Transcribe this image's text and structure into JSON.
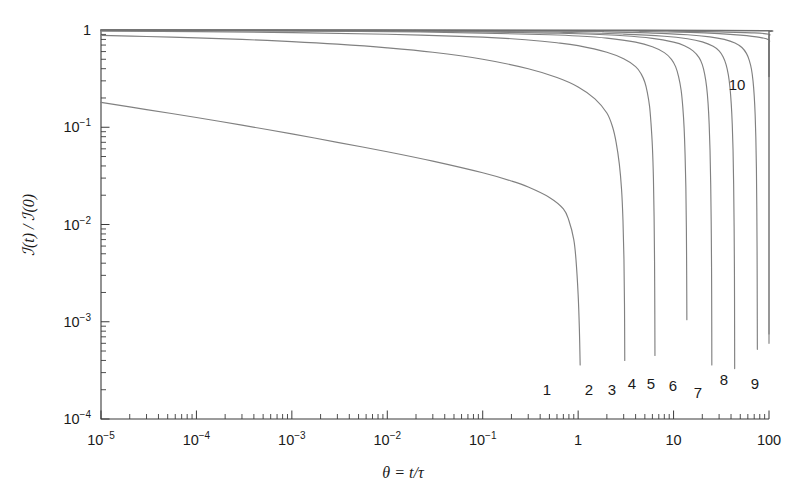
{
  "figure": {
    "background": "#ffffff",
    "curve_color": "#818181",
    "axis_color": "#3b3b3b",
    "text_color": "#1a1a1a"
  },
  "chart_data": {
    "type": "line",
    "title": "",
    "subtitle": "",
    "xlabel": "θ = t/τ",
    "ylabel": "ℐ(t) / ℐ(0)",
    "xscale": "log",
    "yscale": "log",
    "xlim": [
      1e-05,
      100
    ],
    "ylim": [
      0.0001,
      1
    ],
    "grid": false,
    "legend": "inline-curve-labels",
    "xtick_labels": [
      "10⁻⁵",
      "10⁻⁴",
      "10⁻³",
      "10⁻²",
      "10⁻¹",
      "1",
      "10",
      "100"
    ],
    "xtick_values": [
      1e-05,
      0.0001,
      0.001,
      0.01,
      0.1,
      1,
      10,
      100
    ],
    "ytick_labels": [
      "1",
      "10⁻¹",
      "10⁻²",
      "10⁻³",
      "10⁻⁴"
    ],
    "ytick_values": [
      1,
      0.1,
      0.01,
      0.001,
      0.0001
    ],
    "minor_ticks": true,
    "series": [
      {
        "name": "1",
        "label": "1",
        "label_at": {
          "x": 0.62,
          "y": 0.00021
        },
        "points": [
          [
            1e-05,
            0.18
          ],
          [
            3e-05,
            0.152
          ],
          [
            0.0001,
            0.126
          ],
          [
            0.0003,
            0.105
          ],
          [
            0.001,
            0.0855
          ],
          [
            0.003,
            0.07
          ],
          [
            0.01,
            0.056
          ],
          [
            0.03,
            0.0448
          ],
          [
            0.1,
            0.034
          ],
          [
            0.2,
            0.028
          ],
          [
            0.3,
            0.0243
          ],
          [
            0.5,
            0.019
          ],
          [
            0.7,
            0.0145
          ],
          [
            0.8,
            0.011
          ],
          [
            0.9,
            0.007
          ],
          [
            0.95,
            0.0043
          ],
          [
            1.0,
            0.0019
          ],
          [
            1.03,
            0.00085
          ],
          [
            1.05,
            0.00036
          ]
        ]
      },
      {
        "name": "2",
        "label": "2",
        "label_at": {
          "x": 1.55,
          "y": 0.00021
        },
        "points": [
          [
            1e-05,
            0.88
          ],
          [
            3e-05,
            0.858
          ],
          [
            0.0001,
            0.83
          ],
          [
            0.0003,
            0.8
          ],
          [
            0.001,
            0.76
          ],
          [
            0.003,
            0.715
          ],
          [
            0.01,
            0.655
          ],
          [
            0.03,
            0.59
          ],
          [
            0.1,
            0.5
          ],
          [
            0.3,
            0.4
          ],
          [
            0.6,
            0.325
          ],
          [
            1.0,
            0.26
          ],
          [
            1.5,
            0.196
          ],
          [
            2.0,
            0.14
          ],
          [
            2.3,
            0.1
          ],
          [
            2.5,
            0.07
          ],
          [
            2.7,
            0.042
          ],
          [
            2.85,
            0.023
          ],
          [
            2.95,
            0.011
          ],
          [
            3.02,
            0.0044
          ],
          [
            3.06,
            0.0015
          ],
          [
            3.08,
            0.0004
          ]
        ]
      },
      {
        "name": "3",
        "label": "3",
        "label_at": {
          "x": 2.55,
          "y": 0.00021
        },
        "points": [
          [
            1e-05,
            0.975
          ],
          [
            0.0001,
            0.962
          ],
          [
            0.001,
            0.94
          ],
          [
            0.01,
            0.905
          ],
          [
            0.1,
            0.845
          ],
          [
            0.3,
            0.79
          ],
          [
            0.6,
            0.74
          ],
          [
            1.0,
            0.69
          ],
          [
            2.0,
            0.59
          ],
          [
            3.0,
            0.505
          ],
          [
            4.0,
            0.42
          ],
          [
            4.6,
            0.35
          ],
          [
            5.0,
            0.29
          ],
          [
            5.3,
            0.23
          ],
          [
            5.6,
            0.165
          ],
          [
            5.8,
            0.11
          ],
          [
            6.0,
            0.063
          ],
          [
            6.15,
            0.03
          ],
          [
            6.25,
            0.012
          ],
          [
            6.32,
            0.0042
          ],
          [
            6.36,
            0.0012
          ],
          [
            6.38,
            0.00045
          ]
        ]
      },
      {
        "name": "4",
        "label": "4",
        "label_at": {
          "x": 4.2,
          "y": 0.00021
        },
        "points": [
          [
            1e-05,
            0.99
          ],
          [
            0.001,
            0.978
          ],
          [
            0.01,
            0.962
          ],
          [
            0.1,
            0.93
          ],
          [
            0.5,
            0.893
          ],
          [
            1.0,
            0.868
          ],
          [
            2.0,
            0.825
          ],
          [
            4.0,
            0.75
          ],
          [
            6.0,
            0.672
          ],
          [
            8.0,
            0.585
          ],
          [
            9.5,
            0.5
          ],
          [
            10.5,
            0.42
          ],
          [
            11.3,
            0.33
          ],
          [
            12.0,
            0.24
          ],
          [
            12.5,
            0.16
          ],
          [
            12.9,
            0.098
          ],
          [
            13.2,
            0.052
          ],
          [
            13.45,
            0.024
          ],
          [
            13.62,
            0.009
          ],
          [
            13.72,
            0.003
          ],
          [
            13.78,
            0.00105
          ]
        ]
      },
      {
        "name": "5",
        "label": "5",
        "label_at": {
          "x": 5.6,
          "y": 0.00021
        },
        "points": [
          [
            1e-05,
            0.994
          ],
          [
            0.01,
            0.976
          ],
          [
            0.1,
            0.955
          ],
          [
            0.5,
            0.93
          ],
          [
            1.0,
            0.915
          ],
          [
            3.0,
            0.872
          ],
          [
            6.0,
            0.82
          ],
          [
            10.0,
            0.75
          ],
          [
            13.0,
            0.69
          ],
          [
            16.0,
            0.61
          ],
          [
            18.5,
            0.52
          ],
          [
            20.0,
            0.44
          ],
          [
            21.2,
            0.35
          ],
          [
            22.2,
            0.26
          ],
          [
            23.0,
            0.175
          ],
          [
            23.6,
            0.108
          ],
          [
            24.1,
            0.058
          ],
          [
            24.5,
            0.026
          ],
          [
            24.8,
            0.01
          ],
          [
            25.0,
            0.0036
          ],
          [
            25.12,
            0.001
          ],
          [
            25.17,
            0.00036
          ]
        ]
      },
      {
        "name": "6",
        "label": "6",
        "label_at": {
          "x": 7.8,
          "y": 0.00021
        },
        "points": [
          [
            1e-05,
            0.996
          ],
          [
            0.1,
            0.968
          ],
          [
            1.0,
            0.938
          ],
          [
            3.0,
            0.908
          ],
          [
            8.0,
            0.862
          ],
          [
            14.0,
            0.812
          ],
          [
            20.0,
            0.755
          ],
          [
            26.0,
            0.68
          ],
          [
            30.0,
            0.61
          ],
          [
            33.0,
            0.53
          ],
          [
            35.5,
            0.44
          ],
          [
            37.5,
            0.345
          ],
          [
            39.0,
            0.255
          ],
          [
            40.2,
            0.175
          ],
          [
            41.2,
            0.108
          ],
          [
            42.0,
            0.058
          ],
          [
            42.6,
            0.026
          ],
          [
            43.1,
            0.0095
          ],
          [
            43.45,
            0.003
          ],
          [
            43.6,
            0.0009
          ],
          [
            43.68,
            0.00033
          ]
        ]
      },
      {
        "name": "7",
        "label": "7",
        "label_at": {
          "x": 12.5,
          "y": 0.00014
        },
        "points": [
          [
            1e-05,
            0.997
          ],
          [
            0.5,
            0.975
          ],
          [
            2.0,
            0.955
          ],
          [
            6.0,
            0.93
          ],
          [
            14.0,
            0.893
          ],
          [
            24.0,
            0.85
          ],
          [
            34.0,
            0.8
          ],
          [
            44.0,
            0.735
          ],
          [
            52.0,
            0.66
          ],
          [
            58.0,
            0.575
          ],
          [
            62.0,
            0.49
          ],
          [
            65.5,
            0.395
          ],
          [
            68.0,
            0.3
          ],
          [
            70.0,
            0.21
          ],
          [
            71.6,
            0.135
          ],
          [
            72.8,
            0.078
          ],
          [
            73.8,
            0.038
          ],
          [
            74.5,
            0.015
          ],
          [
            75.0,
            0.0052
          ],
          [
            75.3,
            0.0016
          ],
          [
            75.5,
            0.00052
          ]
        ]
      },
      {
        "name": "8",
        "label": "8",
        "label_at": {
          "x": 28.0,
          "y": 0.0003
        },
        "points": [
          [
            1e-05,
            0.998
          ],
          [
            1.0,
            0.982
          ],
          [
            5.0,
            0.966
          ],
          [
            15.0,
            0.945
          ],
          [
            30.0,
            0.918
          ],
          [
            50.0,
            0.885
          ],
          [
            80.0,
            0.84
          ],
          [
            110.0,
            0.79
          ],
          [
            140.0,
            0.725
          ],
          [
            165.0,
            0.65
          ],
          [
            185.0,
            0.565
          ],
          [
            200.0,
            0.475
          ],
          [
            212.0,
            0.38
          ],
          [
            222.0,
            0.285
          ],
          [
            229.0,
            0.198
          ],
          [
            234.5,
            0.128
          ],
          [
            239.0,
            0.075
          ],
          [
            242.5,
            0.038
          ],
          [
            245.0,
            0.0165
          ],
          [
            247.0,
            0.006
          ],
          [
            248.2,
            0.0019
          ],
          [
            249.0,
            0.0006
          ]
        ]
      },
      {
        "name": "9",
        "label": "9",
        "label_at": {
          "x": 62.0,
          "y": 0.0003
        },
        "points": [
          [
            1e-05,
            0.9985
          ],
          [
            2.0,
            0.988
          ],
          [
            10.0,
            0.975
          ],
          [
            30.0,
            0.958
          ],
          [
            70.0,
            0.935
          ],
          [
            130.0,
            0.905
          ],
          [
            220.0,
            0.865
          ],
          [
            330.0,
            0.815
          ],
          [
            440.0,
            0.752
          ],
          [
            530.0,
            0.68
          ],
          [
            600.0,
            0.6
          ],
          [
            655.0,
            0.51
          ],
          [
            700.0,
            0.415
          ],
          [
            735.0,
            0.318
          ],
          [
            762.0,
            0.225
          ],
          [
            782.0,
            0.148
          ],
          [
            797.0,
            0.088
          ],
          [
            808.0,
            0.045
          ],
          [
            816.0,
            0.0195
          ],
          [
            822.0,
            0.0072
          ],
          [
            826.0,
            0.0023
          ],
          [
            828.5,
            0.00075
          ]
        ]
      },
      {
        "name": "10",
        "label": "10",
        "label_at": {
          "x": 62.0,
          "y": 0.31
        },
        "points": [
          [
            1e-05,
            0.9993
          ],
          [
            5.0,
            0.995
          ],
          [
            30.0,
            0.988
          ],
          [
            100.0,
            0.98
          ],
          [
            300.0,
            0.968
          ],
          [
            700.0,
            0.952
          ],
          [
            1400.0,
            0.932
          ],
          [
            2200.0,
            0.908
          ],
          [
            3000.0,
            0.88
          ],
          [
            3800.0,
            0.845
          ],
          [
            4500.0,
            0.805
          ],
          [
            5100.0,
            0.76
          ],
          [
            5600.0,
            0.71
          ],
          [
            6000.0,
            0.655
          ],
          [
            6350.0,
            0.595
          ],
          [
            6650.0,
            0.53
          ],
          [
            6900.0,
            0.462
          ],
          [
            7100.0,
            0.396
          ],
          [
            7270.0,
            0.332
          ]
        ]
      }
    ]
  },
  "curve_labels": [
    {
      "text": "1",
      "x": 547,
      "y": 395
    },
    {
      "text": "2",
      "x": 589,
      "y": 395
    },
    {
      "text": "3",
      "x": 612,
      "y": 395
    },
    {
      "text": "4",
      "x": 632,
      "y": 389
    },
    {
      "text": "5",
      "x": 651,
      "y": 389
    },
    {
      "text": "6",
      "x": 673,
      "y": 391
    },
    {
      "text": "7",
      "x": 698,
      "y": 398
    },
    {
      "text": "8",
      "x": 724,
      "y": 385
    },
    {
      "text": "9",
      "x": 755,
      "y": 389
    },
    {
      "text": "10",
      "x": 737,
      "y": 90
    }
  ],
  "axis_titles": {
    "x": "θ = t/τ",
    "y_num": "(t)",
    "y_sep": "/",
    "y_den": "(0)",
    "y_symbol": "ℐ"
  }
}
